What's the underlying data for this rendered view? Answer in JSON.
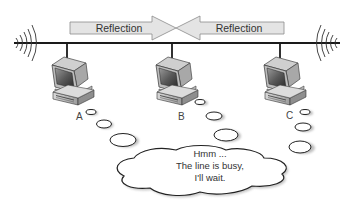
{
  "diagram": {
    "type": "bus-network-reflection",
    "colors": {
      "bus_line": "#1a1a1a",
      "arrow_fill": "#e6e6e6",
      "arrow_stroke": "#8a8a8a",
      "text": "#333333"
    },
    "arrows": [
      {
        "label": "Reflection",
        "direction": "right"
      },
      {
        "label": "Reflection",
        "direction": "left"
      }
    ],
    "nodes": [
      {
        "id": "A",
        "label": "A"
      },
      {
        "id": "B",
        "label": "B"
      },
      {
        "id": "C",
        "label": "C"
      }
    ],
    "terminators": [
      {
        "side": "left",
        "icon": "signal-waves-icon"
      },
      {
        "side": "right",
        "icon": "signal-waves-icon"
      }
    ],
    "thought_bubble": {
      "lines": [
        "Hmm ...",
        "The line is busy,",
        "I'll wait."
      ]
    }
  }
}
